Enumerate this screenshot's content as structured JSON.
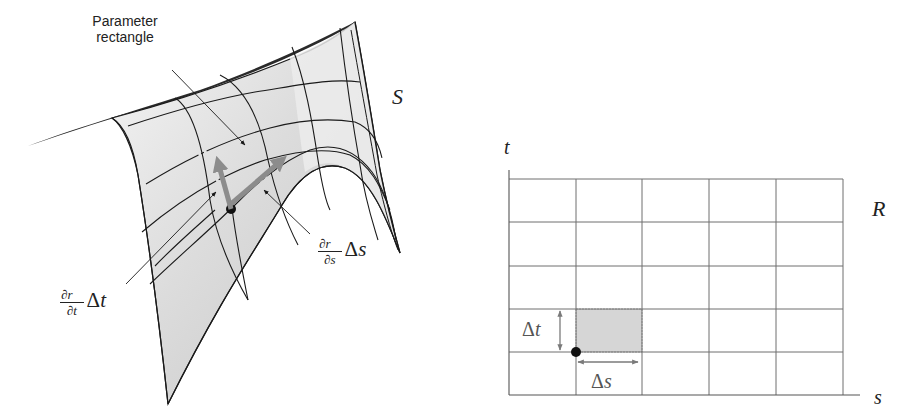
{
  "figure": {
    "left_panel": {
      "surface_label": "S",
      "callout_parameter_rectangle": [
        "Parameter",
        "rectangle"
      ],
      "vector_t_label": {
        "num": "∂r⃗",
        "den": "∂t",
        "factor": "Δ",
        "var": "t"
      },
      "vector_s_label": {
        "num": "∂r⃗",
        "den": "∂s",
        "factor": "Δ",
        "var": "s"
      }
    },
    "right_panel": {
      "region_label": "R",
      "axis_x_label": "s",
      "axis_y_label": "t",
      "grid": {
        "columns": 5,
        "rows": 5
      },
      "delta_t_label": {
        "sym": "Δ",
        "var": "t"
      },
      "delta_s_label": {
        "sym": "Δ",
        "var": "s"
      },
      "highlighted_cell": {
        "column": 2,
        "row_from_bottom": 2
      }
    },
    "colors": {
      "surface_fill": "#d9d9d9",
      "surface_fill_light": "#f2f2f2",
      "line": "#1a1a1a",
      "vector": "#8c8c8c",
      "grid_line": "#6f6f6f",
      "highlight_cell": "#d6d6d6",
      "arrow_gray": "#7a7a7a"
    }
  }
}
